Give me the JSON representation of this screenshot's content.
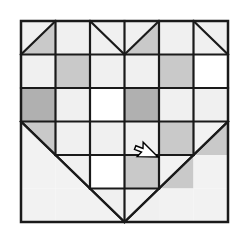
{
  "canvas": {
    "width": 245,
    "height": 235,
    "background": "#ffffff"
  },
  "block": {
    "title": "Heart Quilt Block",
    "kind": "patchwork-quilt-block-diagram",
    "x": 21,
    "y": 21,
    "width": 207,
    "height": 201,
    "rows": 6,
    "columns": 6,
    "border_color": "#1a1a1a",
    "border_width": 2.5,
    "grid_line_color": "#1a1a1a",
    "grid_line_width": 2.2,
    "diagonal_color": "#1a1a1a",
    "diagonal_width": 2.2
  },
  "palette": {
    "background": "#f2f2f2",
    "light": "#f0f0f0",
    "white": "#ffffff",
    "medium_gray": "#c9c9c9",
    "dark_gray": "#b0b0b0",
    "outline": "#1a1a1a",
    "cursor_fill": "#ffffff",
    "cursor_stroke": "#000000"
  },
  "legend": {
    "background_label": "background",
    "light_label": "light",
    "white_label": "white",
    "medium_label": "medium gray",
    "dark_label": "dark gray"
  },
  "cells": [
    [
      {
        "name": "r1c1",
        "fill": "light",
        "diagonal": "bl-tr",
        "tri_upper": "light",
        "tri_lower": "medium_gray"
      },
      {
        "name": "r1c2",
        "fill": "light",
        "diagonal": "none"
      },
      {
        "name": "r1c3",
        "fill": "light",
        "diagonal": "tl-br",
        "tri_upper": "light",
        "tri_lower": "light"
      },
      {
        "name": "r1c4",
        "fill": "light",
        "diagonal": "bl-tr",
        "tri_upper": "light",
        "tri_lower": "medium_gray"
      },
      {
        "name": "r1c5",
        "fill": "light",
        "diagonal": "none"
      },
      {
        "name": "r1c6",
        "fill": "light",
        "diagonal": "tl-br",
        "tri_upper": "light",
        "tri_lower": "light"
      }
    ],
    [
      {
        "name": "r2c1",
        "fill": "light",
        "diagonal": "none"
      },
      {
        "name": "r2c2",
        "fill": "medium_gray",
        "diagonal": "none"
      },
      {
        "name": "r2c3",
        "fill": "light",
        "diagonal": "none"
      },
      {
        "name": "r2c4",
        "fill": "light",
        "diagonal": "none"
      },
      {
        "name": "r2c5",
        "fill": "medium_gray",
        "diagonal": "none"
      },
      {
        "name": "r2c6",
        "fill": "white",
        "diagonal": "none"
      }
    ],
    [
      {
        "name": "r3c1",
        "fill": "dark_gray",
        "diagonal": "none"
      },
      {
        "name": "r3c2",
        "fill": "light",
        "diagonal": "none"
      },
      {
        "name": "r3c3",
        "fill": "white",
        "diagonal": "none"
      },
      {
        "name": "r3c4",
        "fill": "dark_gray",
        "diagonal": "none"
      },
      {
        "name": "r3c5",
        "fill": "light",
        "diagonal": "none"
      },
      {
        "name": "r3c6",
        "fill": "light",
        "diagonal": "none"
      }
    ],
    [
      {
        "name": "r4c1",
        "fill": "medium_gray",
        "diagonal": "tl-br",
        "tri_upper": "medium_gray",
        "tri_lower": "background"
      },
      {
        "name": "r4c2",
        "fill": "light",
        "diagonal": "none"
      },
      {
        "name": "r4c3",
        "fill": "light",
        "diagonal": "none"
      },
      {
        "name": "r4c4",
        "fill": "light",
        "diagonal": "none"
      },
      {
        "name": "r4c5",
        "fill": "medium_gray",
        "diagonal": "none"
      },
      {
        "name": "r4c6",
        "fill": "background",
        "diagonal": "bl-tr",
        "tri_upper": "background",
        "tri_lower": "medium_gray"
      }
    ],
    [
      {
        "name": "r5c1",
        "fill": "background",
        "diagonal": "none"
      },
      {
        "name": "r5c2",
        "fill": "background",
        "diagonal": "tl-br",
        "tri_upper": "light",
        "tri_lower": "background"
      },
      {
        "name": "r5c3",
        "fill": "white",
        "diagonal": "none"
      },
      {
        "name": "r5c4",
        "fill": "medium_gray",
        "diagonal": "none"
      },
      {
        "name": "r5c5",
        "fill": "background",
        "diagonal": "bl-tr",
        "tri_upper": "background",
        "tri_lower": "medium_gray"
      },
      {
        "name": "r5c6",
        "fill": "background",
        "diagonal": "none"
      }
    ],
    [
      {
        "name": "r6c1",
        "fill": "background",
        "diagonal": "none"
      },
      {
        "name": "r6c2",
        "fill": "background",
        "diagonal": "none"
      },
      {
        "name": "r6c3",
        "fill": "background",
        "diagonal": "tl-br",
        "tri_upper": "light",
        "tri_lower": "background"
      },
      {
        "name": "r6c4",
        "fill": "background",
        "diagonal": "bl-tr",
        "tri_upper": "background",
        "tri_lower": "light"
      },
      {
        "name": "r6c5",
        "fill": "background",
        "diagonal": "none"
      },
      {
        "name": "r6c6",
        "fill": "background",
        "diagonal": "none"
      }
    ]
  ],
  "cursor": {
    "name": "mouse-pointer",
    "x": 158,
    "y": 157,
    "rotation": 135,
    "scale": 1.0,
    "fill": "#ffffff",
    "stroke": "#000000"
  }
}
